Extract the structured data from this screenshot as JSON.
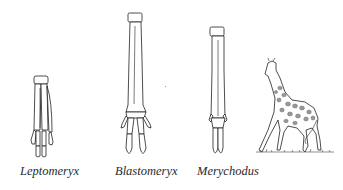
{
  "figure": {
    "type": "evolution-of-limb-bones",
    "panels": [
      {
        "id": "leptomeryx",
        "label": "Leptomeryx",
        "depicts": "short limb bones with separate metapodials and side toes"
      },
      {
        "id": "blastomeryx",
        "label": "Blastomeryx",
        "depicts": "elongated fused cannon bone with reduced side toes"
      },
      {
        "id": "merychodus",
        "label": "Merychodus",
        "depicts": "elongated fused cannon bone with vestigial side toes"
      },
      {
        "id": "giraffe",
        "label": "",
        "depicts": "modern giraffe illustration"
      }
    ]
  }
}
